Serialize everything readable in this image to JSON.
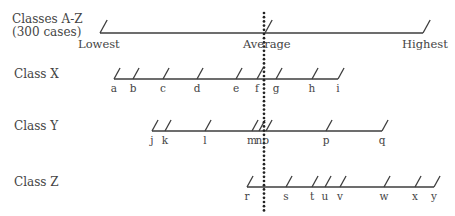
{
  "overall": {
    "label_line1": "Classes A-Z",
    "label_line2": "(300 cases)",
    "lowest_label": "Lowest",
    "average_label": "Average",
    "highest_label": "Highest",
    "axis": {
      "y": 33,
      "x_start": 100,
      "x_end": 423
    },
    "ticks_x": [
      100,
      265,
      423
    ]
  },
  "average_line": {
    "x": 264,
    "y_start": 13,
    "y_end": 212
  },
  "rows": [
    {
      "label": "Class X",
      "label_pos": {
        "x": 14,
        "y": 68
      },
      "axis": {
        "y": 79,
        "x_start": 114,
        "x_end": 338
      },
      "ticks": [
        {
          "name": "a",
          "x": 114
        },
        {
          "name": "b",
          "x": 133
        },
        {
          "name": "c",
          "x": 163
        },
        {
          "name": "d",
          "x": 197
        },
        {
          "name": "e",
          "x": 236
        },
        {
          "name": "f",
          "x": 257
        },
        {
          "name": "g",
          "x": 276
        },
        {
          "name": "h",
          "x": 312
        },
        {
          "name": "i",
          "x": 338
        }
      ]
    },
    {
      "label": "Class Y",
      "label_pos": {
        "x": 14,
        "y": 120
      },
      "axis": {
        "y": 131,
        "x_start": 152,
        "x_end": 382
      },
      "ticks": [
        {
          "name": "j",
          "x": 152
        },
        {
          "name": "k",
          "x": 165
        },
        {
          "name": "l",
          "x": 205
        },
        {
          "name": "m",
          "x": 252
        },
        {
          "name": "n",
          "x": 259
        },
        {
          "name": "o",
          "x": 266
        },
        {
          "name": "p",
          "x": 326
        },
        {
          "name": "q",
          "x": 382
        }
      ]
    },
    {
      "label": "Class Z",
      "label_pos": {
        "x": 14,
        "y": 176
      },
      "axis": {
        "y": 187,
        "x_start": 247,
        "x_end": 434
      },
      "ticks": [
        {
          "name": "r",
          "x": 247
        },
        {
          "name": "s",
          "x": 286
        },
        {
          "name": "t",
          "x": 312
        },
        {
          "name": "u",
          "x": 325
        },
        {
          "name": "v",
          "x": 340
        },
        {
          "name": "w",
          "x": 384
        },
        {
          "name": "x",
          "x": 415
        },
        {
          "name": "y",
          "x": 434
        }
      ]
    }
  ],
  "style": {
    "line_color": "#3c3c3c",
    "dot_color": "#222222"
  }
}
